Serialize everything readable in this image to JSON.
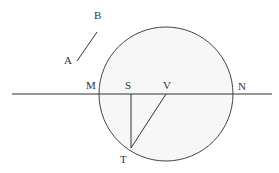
{
  "diagram": {
    "type": "geometric-figure",
    "stroke_color": "#333333",
    "circle_fill": "#f7f7f7",
    "background": "#ffffff",
    "circle": {
      "center_label": "V",
      "cx": 166,
      "cy": 94,
      "r": 67
    },
    "labels": {
      "A": "A",
      "B": "B",
      "M": "M",
      "S": "S",
      "V": "V",
      "N": "N",
      "T": "T"
    },
    "segments": [
      {
        "name": "AB",
        "from": [
          77,
          61
        ],
        "to": [
          97,
          32
        ]
      },
      {
        "name": "horizontal-line-MN",
        "from": [
          12,
          94
        ],
        "to": [
          272,
          94
        ]
      },
      {
        "name": "ST",
        "from": [
          131,
          94
        ],
        "to": [
          131,
          148
        ]
      },
      {
        "name": "VT",
        "from": [
          166,
          94
        ],
        "to": [
          131,
          148
        ]
      }
    ],
    "points": {
      "A": [
        68,
        64
      ],
      "B": [
        98,
        18
      ],
      "M": [
        91,
        88
      ],
      "S": [
        128,
        88
      ],
      "V": [
        166,
        88
      ],
      "N": [
        241,
        90
      ],
      "T": [
        124,
        161
      ]
    }
  }
}
